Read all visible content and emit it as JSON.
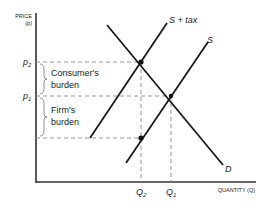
{
  "axes": {
    "y_label_line1": "PRICE",
    "y_label_line2": "(p)",
    "x_label": "QUANTITY (Q)"
  },
  "price_ticks": {
    "p2": "p",
    "p2_sub": "2",
    "p1": "p",
    "p1_sub": "1"
  },
  "quantity_ticks": {
    "q2": "Q",
    "q2_sub": "2",
    "q1": "Q",
    "q1_sub": "1"
  },
  "curves": {
    "supply_tax": "S + tax",
    "supply": "S",
    "demand": "D"
  },
  "burdens": {
    "consumer_line1": "Consumer's",
    "consumer_line2": "burden",
    "firm_line1": "Firm's",
    "firm_line2": "burden"
  },
  "colors": {
    "line": "#1a1a1a",
    "dashed": "#8a8a8a",
    "axis": "#333333"
  }
}
